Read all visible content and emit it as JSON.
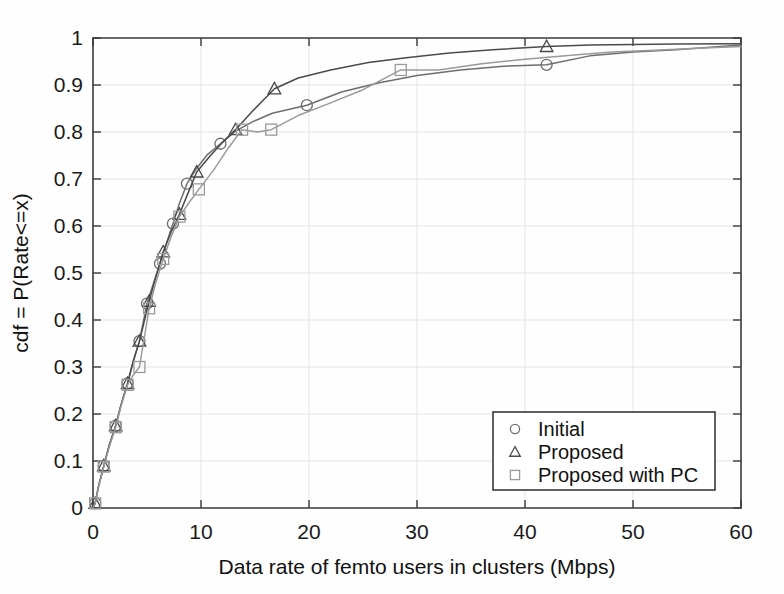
{
  "chart_data": {
    "type": "line",
    "title": "",
    "subtitle": "",
    "xlabel": "Data rate of femto users in clusters (Mbps)",
    "ylabel": "cdf = P(Rate<=x)",
    "xlim": [
      0,
      60
    ],
    "ylim": [
      0,
      1
    ],
    "xticks": [
      0,
      10,
      20,
      30,
      40,
      50,
      60
    ],
    "yticks": [
      0,
      0.1,
      0.2,
      0.3,
      0.4,
      0.5,
      0.6,
      0.7,
      0.8,
      0.9,
      1
    ],
    "xtick_labels": [
      "0",
      "10",
      "20",
      "30",
      "40",
      "50",
      "60"
    ],
    "ytick_labels": [
      "0",
      "0.1",
      "0.2",
      "0.3",
      "0.4",
      "0.5",
      "0.6",
      "0.7",
      "0.8",
      "0.9",
      "1"
    ],
    "grid": true,
    "legend_position": "lower right",
    "series": [
      {
        "name": "Initial",
        "marker": "circle",
        "color": "#6d6d6d",
        "marker_x": [
          0.2,
          1.0,
          2.1,
          3.2,
          4.3,
          5.0,
          6.2,
          7.4,
          8.7,
          11.8,
          19.8,
          42.0
        ],
        "marker_y": [
          0.01,
          0.09,
          0.175,
          0.265,
          0.355,
          0.435,
          0.52,
          0.605,
          0.69,
          0.775,
          0.857,
          0.943
        ],
        "x": [
          0,
          0.2,
          0.5,
          1.0,
          1.5,
          2.1,
          2.6,
          3.2,
          3.7,
          4.3,
          5.0,
          5.6,
          6.2,
          6.8,
          7.4,
          8.0,
          8.7,
          9.6,
          10.6,
          11.8,
          13.2,
          14.8,
          16.6,
          19.8,
          23.0,
          26.5,
          30.0,
          34.0,
          38.0,
          42.0,
          46.0,
          50.0,
          54.0,
          60.0
        ],
        "y": [
          0,
          0.01,
          0.045,
          0.09,
          0.133,
          0.175,
          0.22,
          0.265,
          0.31,
          0.355,
          0.435,
          0.478,
          0.52,
          0.563,
          0.605,
          0.648,
          0.69,
          0.723,
          0.752,
          0.775,
          0.802,
          0.822,
          0.84,
          0.857,
          0.885,
          0.905,
          0.92,
          0.932,
          0.94,
          0.943,
          0.962,
          0.97,
          0.975,
          0.985
        ]
      },
      {
        "name": "Proposed",
        "marker": "triangle",
        "color": "#4a4a4a",
        "marker_x": [
          0.2,
          1.0,
          2.1,
          3.2,
          4.3,
          5.2,
          6.5,
          8.0,
          9.6,
          13.2,
          16.8,
          42.0
        ],
        "marker_y": [
          0.01,
          0.09,
          0.175,
          0.265,
          0.355,
          0.44,
          0.545,
          0.625,
          0.715,
          0.805,
          0.892,
          0.982
        ],
        "x": [
          0,
          0.2,
          0.5,
          1.0,
          1.5,
          2.1,
          2.6,
          3.2,
          3.7,
          4.3,
          5.2,
          5.8,
          6.5,
          7.2,
          8.0,
          8.8,
          9.6,
          10.8,
          12.0,
          13.2,
          14.8,
          16.8,
          19.0,
          22.0,
          25.5,
          29.0,
          33.0,
          37.0,
          42.0,
          46.0,
          50.0,
          54.0,
          60.0
        ],
        "y": [
          0,
          0.01,
          0.045,
          0.09,
          0.133,
          0.175,
          0.22,
          0.265,
          0.31,
          0.355,
          0.44,
          0.49,
          0.545,
          0.585,
          0.625,
          0.67,
          0.715,
          0.748,
          0.778,
          0.805,
          0.845,
          0.892,
          0.915,
          0.932,
          0.948,
          0.958,
          0.968,
          0.975,
          0.982,
          0.985,
          0.986,
          0.987,
          0.988
        ]
      },
      {
        "name": "Proposed with PC",
        "marker": "square",
        "color": "#9a9a9a",
        "marker_x": [
          0.2,
          1.0,
          2.1,
          3.2,
          4.3,
          5.2,
          6.5,
          8.0,
          9.8,
          13.8,
          16.5,
          28.5
        ],
        "marker_y": [
          0.01,
          0.088,
          0.172,
          0.262,
          0.3,
          0.425,
          0.53,
          0.62,
          0.678,
          0.805,
          0.805,
          0.932
        ],
        "x": [
          0,
          0.2,
          0.5,
          1.0,
          1.5,
          2.1,
          2.6,
          3.2,
          3.7,
          4.3,
          5.2,
          5.8,
          6.5,
          7.2,
          8.0,
          8.9,
          9.8,
          11.2,
          12.5,
          13.8,
          15.2,
          16.5,
          19.0,
          22.0,
          25.0,
          28.5,
          32.0,
          36.0,
          40.0,
          44.0,
          48.0,
          52.0,
          56.0,
          60.0
        ],
        "y": [
          0,
          0.01,
          0.043,
          0.088,
          0.13,
          0.172,
          0.217,
          0.262,
          0.282,
          0.3,
          0.425,
          0.478,
          0.53,
          0.575,
          0.62,
          0.65,
          0.678,
          0.72,
          0.765,
          0.805,
          0.8,
          0.805,
          0.835,
          0.862,
          0.89,
          0.932,
          0.932,
          0.945,
          0.955,
          0.963,
          0.97,
          0.974,
          0.978,
          0.982
        ]
      }
    ]
  },
  "legend": {
    "items": [
      {
        "label": "Initial",
        "marker": "circle"
      },
      {
        "label": "Proposed",
        "marker": "triangle"
      },
      {
        "label": "Proposed with PC",
        "marker": "square"
      }
    ]
  },
  "colors": {
    "axis": "#3a3a3a",
    "grid": "#e2e2e2",
    "background": "#fefefe",
    "series_initial": "#6d6d6d",
    "series_proposed": "#4a4a4a",
    "series_proposed_pc": "#9a9a9a"
  }
}
